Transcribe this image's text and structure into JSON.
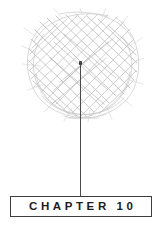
{
  "page": {
    "background_color": "#ffffff",
    "width": 163,
    "height": 230
  },
  "illustration": {
    "name": "scribble-ball",
    "description": "hand-drawn cross-hatched scribble ball",
    "stroke_color": "#b5b5b5",
    "stroke_color_light": "#d2d2d2"
  },
  "connector": {
    "name": "stem-line",
    "color": "#4a4a4a",
    "dot_color": "#3a3a3a"
  },
  "chapter": {
    "label": "CHAPTER 10",
    "number": "10",
    "word": "CHAPTER",
    "border_color": "#3d3d3d",
    "text_color": "#1c1c1c"
  }
}
